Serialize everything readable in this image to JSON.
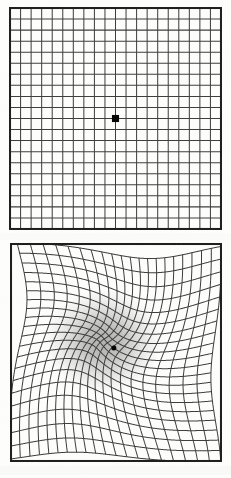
{
  "figure": {
    "background_color": "#fdfdfc",
    "line_color": "#3a3a3a",
    "border_color": "#1a1a1a",
    "fixation_color": "#000000",
    "scotoma_color": "#6e6e6e",
    "panel_count": 2
  },
  "panels": [
    {
      "id": "normal-grid",
      "label": "Normal Amsler grid",
      "state": "undistorted",
      "grid": {
        "columns": 20,
        "rows": 20,
        "cell_size_px": 10.6,
        "border_width_px": 2,
        "line_width_px": 1
      },
      "fixation_point": {
        "shape": "square",
        "size_px": 7,
        "center_x_fraction": 0.5,
        "center_y_fraction": 0.5,
        "color": "#000000"
      },
      "distortion": {
        "present": false,
        "strength": 0.0
      }
    },
    {
      "id": "distorted-grid",
      "label": "Distorted Amsler grid (metamorphopsia)",
      "state": "distorted",
      "grid": {
        "columns": 20,
        "rows": 20,
        "cell_size_px": 10.55,
        "border_width_px": 2,
        "line_width_px": 1
      },
      "fixation_point": {
        "shape": "circle",
        "size_px": 5,
        "center_x_fraction": 0.49,
        "center_y_fraction": 0.48,
        "color": "#000000"
      },
      "distortion": {
        "present": true,
        "type": "vortex-pinch",
        "center_x_fraction": 0.455,
        "center_y_fraction": 0.455,
        "radius_fraction": 0.4,
        "pinch_strength": 0.62,
        "swirl_degrees": 55,
        "scotoma": {
          "present": true,
          "center_x_fraction": 0.44,
          "center_y_fraction": 0.45,
          "radius_fraction": 0.175,
          "max_opacity": 0.55,
          "color": "#6e6e6e"
        }
      }
    }
  ],
  "chart_data": {
    "type": "line",
    "xlabel": "",
    "ylabel": "",
    "grid": true,
    "legend": "none",
    "series": [
      {
        "name": "normal-grid-vertical-lines",
        "values": 21
      },
      {
        "name": "normal-grid-horizontal-lines",
        "values": 21
      },
      {
        "name": "distorted-grid-vertical-lines",
        "values": 21
      },
      {
        "name": "distorted-grid-horizontal-lines",
        "values": 21
      }
    ]
  }
}
